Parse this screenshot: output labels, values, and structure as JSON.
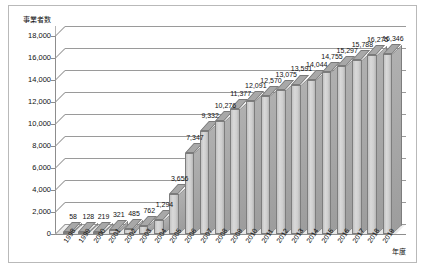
{
  "chart_data": {
    "type": "bar",
    "title": "",
    "subtitle": "",
    "xlabel": "年度",
    "ylabel": "事業者数",
    "ylim": [
      0,
      18000
    ],
    "ystep": 2000,
    "grid": true,
    "legend": "none",
    "style": "3d-column",
    "bar_color": "#cfcfcf",
    "bar_edge_color": "#7d7d7d",
    "gridline_color": "#9a9a9a",
    "axis_color": "#8d8d8d",
    "frame_color": "#b9b9b9",
    "background_color": "#ffffff",
    "ytick_labels": [
      "18,000",
      "16,000",
      "14,000",
      "12,000",
      "10,000",
      "8,000",
      "6,000",
      "4,000",
      "2,000",
      "0"
    ],
    "ytick_values": [
      18000,
      16000,
      14000,
      12000,
      10000,
      8000,
      6000,
      4000,
      2000,
      0
    ],
    "categories": [
      "1998",
      "1999",
      "2000",
      "2001",
      "2002",
      "2003",
      "2004",
      "2005",
      "2006",
      "2007",
      "2008",
      "2009",
      "2010",
      "2011",
      "2012",
      "2013",
      "2014",
      "2015",
      "2016",
      "2017",
      "2018",
      "2019"
    ],
    "values": [
      58,
      128,
      219,
      321,
      485,
      762,
      1294,
      3656,
      7347,
      9332,
      10276,
      11377,
      12091,
      12570,
      13075,
      13591,
      14044,
      14755,
      15297,
      15788,
      16275,
      16346
    ],
    "data_labels": [
      "58",
      "128",
      "219",
      "321",
      "485",
      "762",
      "1,294",
      "3,656",
      "7,347",
      "9,332",
      "10,276",
      "11,377",
      "12,091",
      "12,570",
      "13,075",
      "13,591",
      "14,044",
      "14,755",
      "15,297",
      "15,788",
      "16,275",
      "16,346"
    ]
  }
}
